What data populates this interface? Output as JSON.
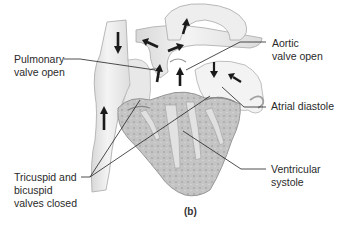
{
  "figure": {
    "panel_label": "(b)",
    "labels": {
      "pulmonary_valve": "Pulmonary\nvalve open",
      "aortic_valve": "Aortic\nvalve open",
      "atrial_diastole": "Atrial diastole",
      "av_valves": "Tricuspid and\nbicuspid\nvalves closed",
      "ventricular_systole": "Ventricular\nsystole"
    },
    "colors": {
      "background": "#ffffff",
      "tissue_light": "#ececec",
      "tissue_mid": "#cfcfcf",
      "myocardium": "#b8b8b8",
      "outline": "#9a9a9a",
      "arrow": "#1a1a1a",
      "leader_line": "#222222",
      "text": "#2a2a2a"
    }
  }
}
